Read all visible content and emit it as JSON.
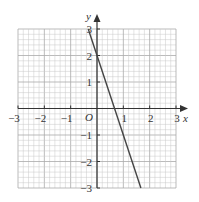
{
  "chart_data": {
    "type": "line",
    "title": "",
    "xlabel": "x",
    "ylabel": "y",
    "origin_label": "O",
    "xlim": [
      -3,
      3
    ],
    "ylim": [
      -3,
      3
    ],
    "grid": true,
    "minor_divisions_per_unit": 5,
    "x_ticks": [
      "-3",
      "-2",
      "-1",
      "1",
      "2",
      "3"
    ],
    "y_ticks": [
      "3",
      "2",
      "1",
      "-1",
      "-2",
      "-3"
    ],
    "series": [
      {
        "name": "y = -3x + 2",
        "x": [
          -0.333,
          1.667
        ],
        "y": [
          3,
          -3
        ]
      }
    ],
    "colors": {
      "grid": "#c8c8c8",
      "axis": "#333333",
      "line": "#444444"
    }
  }
}
